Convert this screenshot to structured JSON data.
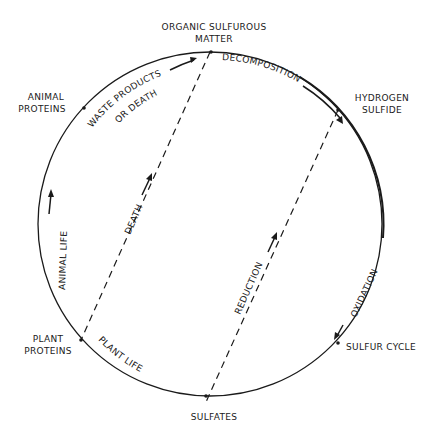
{
  "diagram": {
    "title": "SULFUR CYCLE",
    "nodes": {
      "organic": [
        "ORGANIC SULFUROUS",
        "MATTER"
      ],
      "hydrogen": [
        "HYDROGEN",
        "SULFIDE"
      ],
      "animal": [
        "ANIMAL",
        "PROTEINS"
      ],
      "plant": [
        "PLANT",
        "PROTEINS"
      ],
      "sulfates": "SULFATES"
    },
    "processes": {
      "waste": [
        "WASTE PRODUCTS",
        "OR DEATH"
      ],
      "decomposition": "DECOMPOSITION",
      "oxidation": "OXIDATION",
      "plant_life": "PLANT LIFE",
      "animal_life": "ANIMAL LIFE",
      "death": "DEATH",
      "reduction": "REDUCTION"
    },
    "colors": {
      "line": "#1a1a1a",
      "background": "#ffffff"
    }
  }
}
